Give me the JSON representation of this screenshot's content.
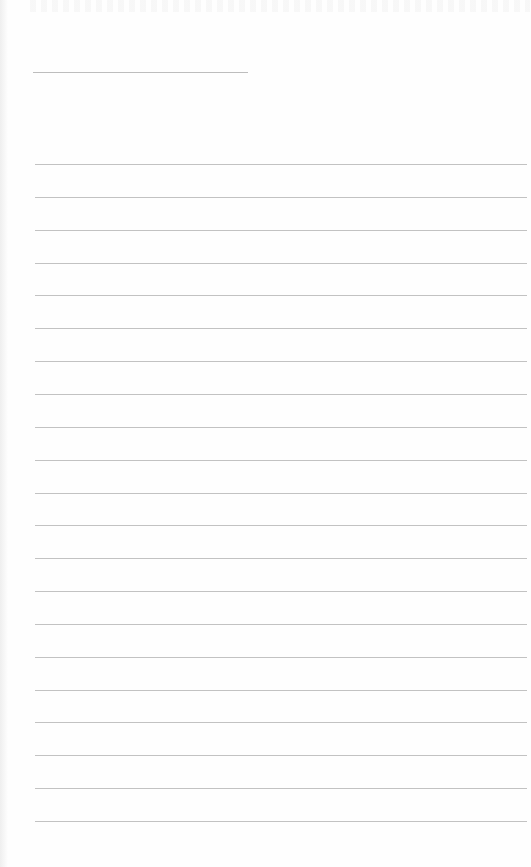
{
  "document": {
    "type": "blank lined writing page",
    "heading_line": {
      "left": 33,
      "top": 72,
      "width": 215
    },
    "ruled_lines": {
      "count": 21,
      "first_top": 164,
      "spacing": 32.85,
      "left": 35,
      "width": 492
    },
    "line_color": "#c2c2c2",
    "background_color": "#fefefe"
  }
}
